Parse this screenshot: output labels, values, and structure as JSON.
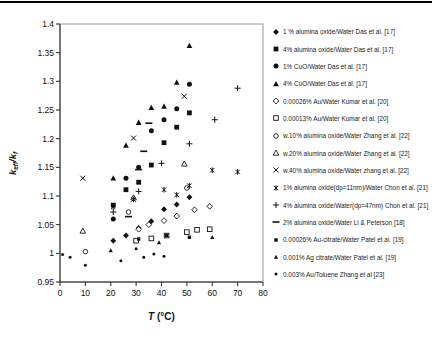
{
  "chart_data": {
    "type": "scatter",
    "title": "",
    "xlabel_italic": "T",
    "xlabel_rest": " (°C)",
    "ylabel_parts": {
      "k1": "k",
      "sub1": "eff",
      "slash_k": "/k",
      "sub2": "f"
    },
    "xlim": [
      0,
      80
    ],
    "ylim": [
      0.95,
      1.4
    ],
    "x_ticks": [
      0,
      10,
      20,
      30,
      40,
      50,
      60,
      70,
      80
    ],
    "y_ticks": [
      0.95,
      1.0,
      1.05,
      1.1,
      1.15,
      1.2,
      1.25,
      1.3,
      1.35,
      1.4
    ],
    "y_tick_labels": [
      "0.95",
      "1",
      "1.05",
      "1.1",
      "1.15",
      "1.2",
      "1.25",
      "1.3",
      "1.35",
      "1.4"
    ],
    "grid": false,
    "legend_position": "right",
    "series": [
      {
        "name": "1 % alumina oxide/Water Das et al. [17]",
        "marker": "diamond-filled",
        "points": [
          [
            21,
            1.022
          ],
          [
            26,
            1.031
          ],
          [
            31,
            1.044
          ],
          [
            36,
            1.056
          ],
          [
            41,
            1.077
          ],
          [
            46,
            1.085
          ],
          [
            51,
            1.098
          ]
        ]
      },
      {
        "name": "4% alumina oxide/Water Das et al. [17]",
        "marker": "square-filled",
        "points": [
          [
            21,
            1.084
          ],
          [
            26,
            1.111
          ],
          [
            31,
            1.124
          ],
          [
            36,
            1.154
          ],
          [
            41,
            1.193
          ],
          [
            46,
            1.22
          ],
          [
            51,
            1.245
          ]
        ]
      },
      {
        "name": "1% CuO/Water Das et al. [17]",
        "marker": "circle-filled",
        "points": [
          [
            21,
            1.06
          ],
          [
            26,
            1.131
          ],
          [
            31,
            1.15
          ],
          [
            36,
            1.214
          ],
          [
            41,
            1.233
          ],
          [
            46,
            1.252
          ],
          [
            51,
            1.295
          ]
        ]
      },
      {
        "name": "4% CuO/Water Das et al. [17]",
        "marker": "triangle-filled",
        "points": [
          [
            21,
            1.131
          ],
          [
            26,
            1.188
          ],
          [
            31,
            1.228
          ],
          [
            36,
            1.254
          ],
          [
            41,
            1.256
          ],
          [
            46,
            1.298
          ],
          [
            51,
            1.362
          ]
        ]
      },
      {
        "name": "0.00026% Au/Water Kumar et al. [20]",
        "marker": "diamond-open",
        "points": [
          [
            31,
            1.042
          ],
          [
            35,
            1.05
          ],
          [
            41,
            1.057
          ],
          [
            46,
            1.065
          ],
          [
            53,
            1.076
          ],
          [
            59,
            1.082
          ]
        ]
      },
      {
        "name": "0.00013% Au/Water Kumar et al. [20]",
        "marker": "square-open",
        "points": [
          [
            30,
            1.022
          ],
          [
            36,
            1.026
          ],
          [
            42,
            1.031
          ],
          [
            50,
            1.037
          ],
          [
            54,
            1.041
          ],
          [
            59,
            1.042
          ]
        ]
      },
      {
        "name": "w.10% alumina oxide/Water Zhang et al. [22]",
        "marker": "circle-open",
        "points": [
          [
            10,
            1.003
          ],
          [
            27,
            1.072
          ],
          [
            50,
            1.114
          ]
        ]
      },
      {
        "name": "w.20% alumina oxide/Water Zhang et al. [22]",
        "marker": "triangle-open",
        "points": [
          [
            9,
            1.039
          ],
          [
            29,
            1.097
          ],
          [
            49,
            1.156
          ]
        ]
      },
      {
        "name": "w.40% alumina oxide/Water zhang et al. [22]",
        "marker": "x",
        "points": [
          [
            9,
            1.131
          ],
          [
            29,
            1.201
          ],
          [
            49,
            1.274
          ]
        ]
      },
      {
        "name": "1% alumina oxide(dp=11nm)/Water Chon et al. [21]",
        "marker": "asterisk",
        "points": [
          [
            21,
            1.081
          ],
          [
            29,
            1.094
          ],
          [
            41,
            1.111
          ],
          [
            46,
            1.102
          ],
          [
            51,
            1.118
          ],
          [
            60,
            1.145
          ],
          [
            70,
            1.142
          ]
        ]
      },
      {
        "name": "4% alumina oxide/Water(dp=47nm) Chon et al. [21]",
        "marker": "plus",
        "points": [
          [
            21,
            1.072
          ],
          [
            31,
            1.108
          ],
          [
            40,
            1.157
          ],
          [
            51,
            1.191
          ],
          [
            61,
            1.233
          ],
          [
            70,
            1.288
          ]
        ]
      },
      {
        "name": "2% alumina oxide/Water Li & Peterson [18]",
        "marker": "dash",
        "points": [
          [
            27,
            1.064
          ],
          [
            31,
            1.146
          ],
          [
            33,
            1.178
          ],
          [
            35,
            1.227
          ]
        ]
      },
      {
        "name": "0.00026% Au-citrate/Water Patel et al. [19]",
        "marker": "square-small-filled",
        "points": [
          [
            31,
            1.025
          ],
          [
            42,
            1.031
          ],
          [
            51,
            1.028
          ]
        ]
      },
      {
        "name": "0.001% Ag citrate/Water Patel et al. [19]",
        "marker": "triangle-small-filled",
        "points": [
          [
            20,
            1.005
          ],
          [
            39,
            1.019
          ],
          [
            60,
            1.028
          ]
        ]
      },
      {
        "name": "0.003% Au/Toluene Zhang et al [23]",
        "marker": "dot",
        "points": [
          [
            1,
            0.998
          ],
          [
            4,
            0.993
          ],
          [
            10,
            0.979
          ],
          [
            24,
            0.987
          ],
          [
            30,
            1.008
          ],
          [
            33,
            0.993
          ],
          [
            37,
            0.999
          ],
          [
            41,
            0.995
          ]
        ]
      }
    ]
  }
}
